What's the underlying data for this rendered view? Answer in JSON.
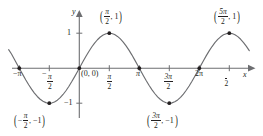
{
  "figure": {
    "kind": "sine-curve-graph",
    "axis_labels": {
      "x": "x",
      "y": "y"
    },
    "y_ticks": [
      {
        "value": 1,
        "label": "1"
      },
      {
        "value": -1,
        "label": "−1"
      }
    ],
    "x_ticks": [
      {
        "value": -3.14159,
        "label": "−π",
        "kind": "plain"
      },
      {
        "value": -1.5708,
        "label": "−π/2",
        "kind": "fraction",
        "sign": "−",
        "num": "π",
        "den": "2"
      },
      {
        "value": 1.5708,
        "label": "π/2",
        "kind": "fraction",
        "sign": "",
        "num": "π",
        "den": "2"
      },
      {
        "value": 3.14159,
        "label": "π",
        "kind": "plain"
      },
      {
        "value": 4.71239,
        "label": "3π/2",
        "kind": "fraction",
        "sign": "",
        "num": "3π",
        "den": "2"
      },
      {
        "value": 6.28319,
        "label": "2π",
        "kind": "plain"
      },
      {
        "value": 7.85398,
        "label": "5π/2",
        "kind": "fraction",
        "sign": "",
        "num": "5π",
        "den": "2"
      }
    ],
    "origin_label": "(0, 0)",
    "point_labels": [
      {
        "id": "max-1",
        "x": 1.5708,
        "y": 1,
        "num": "π",
        "den": "2",
        "sign": "",
        "ycoord": "1",
        "text": "(π/2, 1)"
      },
      {
        "id": "max-2",
        "x": 7.85398,
        "y": 1,
        "num": "5π",
        "den": "2",
        "sign": "",
        "ycoord": "1",
        "text": "(5π/2, 1)"
      },
      {
        "id": "min-1",
        "x": -1.5708,
        "y": -1,
        "num": "π",
        "den": "2",
        "sign": "−",
        "ycoord": "−1",
        "text": "(−π/2, −1)"
      },
      {
        "id": "min-2",
        "x": 4.71239,
        "y": -1,
        "num": "3π",
        "den": "2",
        "sign": "",
        "ycoord": "−1",
        "text": "(3π/2, −1)"
      }
    ]
  },
  "chart_data": {
    "type": "line",
    "title": "",
    "xlabel": "x",
    "ylabel": "y",
    "function": "y = sin(x)",
    "xlim": [
      -3.7,
      8.9
    ],
    "ylim": [
      -1.45,
      1.45
    ],
    "grid": false,
    "legend": null,
    "x_tick_values": [
      -3.14159,
      -1.5708,
      1.5708,
      3.14159,
      4.71239,
      6.28319,
      7.85398
    ],
    "x_tick_labels": [
      "−π",
      "−π/2",
      "π/2",
      "π",
      "3π/2",
      "2π",
      "5π/2"
    ],
    "y_tick_values": [
      1,
      -1
    ],
    "y_tick_labels": [
      "1",
      "−1"
    ],
    "marked_points": [
      {
        "x": -3.14159,
        "y": 0,
        "label": ""
      },
      {
        "x": -1.5708,
        "y": -1,
        "label": "(−π/2, −1)"
      },
      {
        "x": 0,
        "y": 0,
        "label": "(0, 0)"
      },
      {
        "x": 1.5708,
        "y": 1,
        "label": "(π/2, 1)"
      },
      {
        "x": 3.14159,
        "y": 0,
        "label": ""
      },
      {
        "x": 4.71239,
        "y": -1,
        "label": "(3π/2, −1)"
      },
      {
        "x": 6.28319,
        "y": 0,
        "label": ""
      },
      {
        "x": 7.85398,
        "y": 1,
        "label": "(5π/2, 1)"
      }
    ],
    "series": [
      {
        "name": "sin(x)",
        "color": "#6d6e71",
        "x": [
          -3.7,
          -3.55,
          -3.4,
          -3.25,
          -3.1,
          -2.95,
          -2.8,
          -2.65,
          -2.5,
          -2.35,
          -2.2,
          -2.05,
          -1.9,
          -1.75,
          -1.6,
          -1.45,
          -1.3,
          -1.15,
          -1.0,
          -0.85,
          -0.7,
          -0.55,
          -0.4,
          -0.25,
          -0.1,
          0.05,
          0.2,
          0.35,
          0.5,
          0.65,
          0.8,
          0.95,
          1.1,
          1.25,
          1.4,
          1.55,
          1.7,
          1.85,
          2.0,
          2.15,
          2.3,
          2.45,
          2.6,
          2.75,
          2.9,
          3.05,
          3.2,
          3.35,
          3.5,
          3.65,
          3.8,
          3.95,
          4.1,
          4.25,
          4.4,
          4.55,
          4.7,
          4.85,
          5.0,
          5.15,
          5.3,
          5.45,
          5.6,
          5.75,
          5.9,
          6.05,
          6.2,
          6.35,
          6.5,
          6.65,
          6.8,
          6.95,
          7.1,
          7.25,
          7.4,
          7.55,
          7.7,
          7.85,
          8.0,
          8.15,
          8.3,
          8.45,
          8.6,
          8.75,
          8.9
        ],
        "y": [
          0.53,
          0.404,
          0.256,
          0.108,
          -0.042,
          -0.191,
          -0.335,
          -0.472,
          -0.599,
          -0.711,
          -0.808,
          -0.887,
          -0.946,
          -0.984,
          -1.0,
          -0.993,
          -0.964,
          -0.913,
          -0.841,
          -0.751,
          -0.644,
          -0.523,
          -0.389,
          -0.247,
          -0.1,
          0.05,
          0.199,
          0.343,
          0.479,
          0.605,
          0.717,
          0.813,
          0.891,
          0.949,
          0.985,
          1.0,
          0.992,
          0.961,
          0.909,
          0.837,
          0.746,
          0.638,
          0.516,
          0.382,
          0.239,
          0.091,
          -0.058,
          -0.206,
          -0.351,
          -0.488,
          -0.612,
          -0.723,
          -0.818,
          -0.894,
          -0.952,
          -0.986,
          -1.0,
          -0.991,
          -0.959,
          -0.906,
          -0.832,
          -0.74,
          -0.631,
          -0.508,
          -0.374,
          -0.232,
          -0.083,
          0.067,
          0.215,
          0.359,
          0.494,
          0.619,
          0.729,
          0.822,
          0.897,
          0.954,
          0.987,
          1.0,
          0.989,
          0.956,
          0.902,
          0.826,
          0.733,
          0.624,
          0.501
        ]
      }
    ]
  }
}
